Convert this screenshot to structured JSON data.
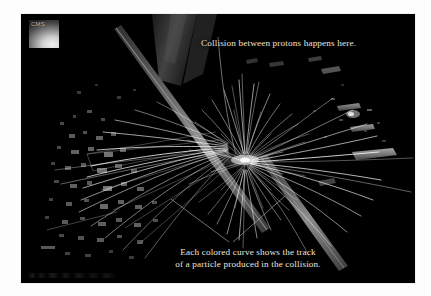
{
  "figure": {
    "kind": "particle-collision-event-display",
    "experiment_logo_text": "CMS",
    "background_color": "#000000",
    "plate_border_color": "#ffffff",
    "caption_color": "#ece6dc",
    "track_color": "#ffffff",
    "leader_line_color": "#b9b2a6",
    "detector_hit_color": "#9a9a9a"
  },
  "annotations": {
    "top": {
      "text": "Collision between protons happens here.",
      "leader_target": "collision-vertex"
    },
    "bottom": {
      "line1": "Each colored curve shows the track",
      "line2": "of a particle produced in the collision.",
      "leader_target": "particle-tracks"
    }
  },
  "event": {
    "vertex": {
      "x": 228,
      "y": 148
    },
    "track_count": 168,
    "beam_axis_angle_deg": -14
  }
}
